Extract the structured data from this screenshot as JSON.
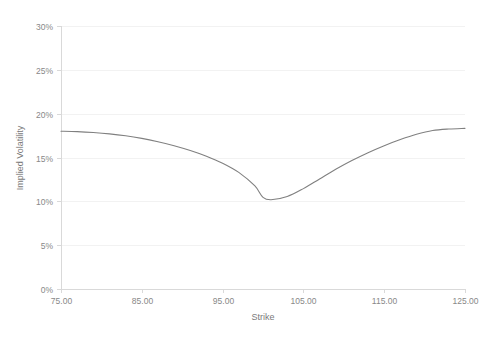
{
  "chart_data": {
    "type": "line",
    "title": "",
    "subtitle": "",
    "xlabel": "Strike",
    "ylabel": "Implied Volatility",
    "xlim": [
      75,
      125
    ],
    "ylim": [
      0,
      0.3
    ],
    "grid": true,
    "grid_axis": "y",
    "legend": false,
    "legend_position": "none",
    "x_tick_labels": [
      "75.00",
      "85.00",
      "95.00",
      "105.00",
      "115.00",
      "125.00"
    ],
    "x_ticks": [
      75,
      85,
      95,
      105,
      115,
      125
    ],
    "y_tick_labels": [
      "0%",
      "5%",
      "10%",
      "15%",
      "20%",
      "25%",
      "30%"
    ],
    "y_ticks": [
      0,
      0.05,
      0.1,
      0.15,
      0.2,
      0.25,
      0.3
    ],
    "series": [
      {
        "name": "Implied Volatility",
        "color": "#808080",
        "x": [
          75,
          77,
          79,
          81,
          83,
          85,
          87,
          89,
          91,
          93,
          95,
          97,
          99,
          100,
          101,
          103,
          105,
          107,
          109,
          111,
          113,
          115,
          117,
          119,
          121,
          123,
          125
        ],
        "values": [
          0.18,
          0.1795,
          0.1785,
          0.177,
          0.1748,
          0.1718,
          0.168,
          0.1635,
          0.158,
          0.1515,
          0.1435,
          0.133,
          0.1175,
          0.1045,
          0.1018,
          0.1055,
          0.1145,
          0.1255,
          0.1365,
          0.1465,
          0.1555,
          0.1635,
          0.1705,
          0.1765,
          0.1808,
          0.1825,
          0.1832
        ]
      }
    ]
  },
  "axes": {
    "y_axis_title": "Implied Volatility",
    "x_axis_title": "Strike"
  },
  "colors": {
    "series_line": "#808080",
    "gridline": "#f2f2f2",
    "axis_line": "#d9d9d9",
    "tick_text": "#888888",
    "axis_title_text": "#7a7a7a",
    "plot_background": "#ffffff"
  }
}
